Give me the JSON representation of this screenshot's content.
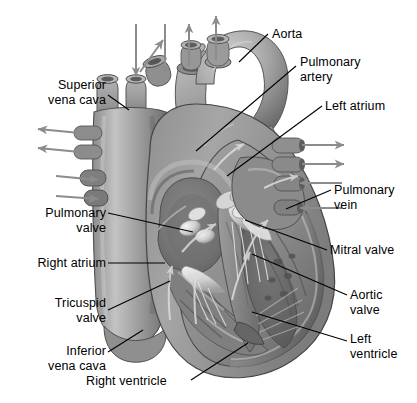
{
  "figure": {
    "background_color": "#ffffff",
    "line_color": "#000000",
    "palette": {
      "muscle_mid": "#9a9a9a",
      "muscle_dark": "#6e6e6e",
      "muscle_darker": "#575757",
      "vessel_light": "#b8b8b8",
      "chamber_dark": "#7b7b7b",
      "highlight": "#e9e9e9",
      "outline": "#2f2f2f",
      "flow_arrow": "#d8d8d8",
      "ext_arrow": "#8c8c8c"
    }
  },
  "labels": [
    {
      "id": "superior-vena-cava",
      "text": "Superior\nvena cava",
      "align": "right",
      "x": 28,
      "y": 78,
      "width": 78
    },
    {
      "id": "aorta",
      "text": "Aorta",
      "align": "left",
      "x": 272,
      "y": 27,
      "width": 60
    },
    {
      "id": "pulmonary-artery",
      "text": "Pulmonary\nartery",
      "align": "left",
      "x": 300,
      "y": 55,
      "width": 80
    },
    {
      "id": "left-atrium",
      "text": "Left atrium",
      "align": "left",
      "x": 325,
      "y": 99,
      "width": 80
    },
    {
      "id": "pulmonary-vein",
      "text": "Pulmonary\nvein",
      "align": "left",
      "x": 334,
      "y": 183,
      "width": 80
    },
    {
      "id": "pulmonary-valve",
      "text": "Pulmonary\nvalve",
      "align": "right",
      "x": 18,
      "y": 206,
      "width": 88
    },
    {
      "id": "mitral-valve",
      "text": "Mitral valve",
      "align": "left",
      "x": 330,
      "y": 243,
      "width": 86
    },
    {
      "id": "right-atrium",
      "text": "Right atrium",
      "align": "right",
      "x": 14,
      "y": 256,
      "width": 92
    },
    {
      "id": "aortic-valve",
      "text": "Aortic\nvalve",
      "align": "left",
      "x": 350,
      "y": 288,
      "width": 60
    },
    {
      "id": "tricuspid-valve",
      "text": "Tricuspid\nvalve",
      "align": "right",
      "x": 22,
      "y": 296,
      "width": 84
    },
    {
      "id": "left-ventricle",
      "text": "Left\nventricle",
      "align": "left",
      "x": 350,
      "y": 332,
      "width": 66
    },
    {
      "id": "inferior-vena-cava",
      "text": "Inferior\nvena cava",
      "align": "right",
      "x": 22,
      "y": 344,
      "width": 84
    },
    {
      "id": "right-ventricle",
      "text": "Right ventricle",
      "align": "left",
      "x": 86,
      "y": 374,
      "width": 104
    }
  ],
  "leader_lines": [
    {
      "id": "leader-superior-vena-cava",
      "from": [
        108,
        95
      ],
      "to": [
        129,
        110
      ]
    },
    {
      "id": "leader-aorta",
      "from": [
        268,
        34
      ],
      "to": [
        239,
        62
      ]
    },
    {
      "id": "leader-pulmonary-artery",
      "from": [
        296,
        66
      ],
      "to": [
        196,
        151
      ]
    },
    {
      "id": "leader-left-atrium",
      "from": [
        322,
        106
      ],
      "to": [
        227,
        176
      ]
    },
    {
      "id": "leader-pulmonary-vein",
      "from": [
        331,
        190
      ],
      "to": [
        286,
        209
      ]
    },
    {
      "id": "leader-pulmonary-valve",
      "from": [
        108,
        213
      ],
      "to": [
        193,
        232
      ]
    },
    {
      "id": "leader-mitral-valve",
      "from": [
        327,
        250
      ],
      "to": [
        245,
        220
      ]
    },
    {
      "id": "leader-right-atrium",
      "from": [
        108,
        263
      ],
      "to": [
        165,
        263
      ]
    },
    {
      "id": "leader-aortic-valve",
      "from": [
        347,
        295
      ],
      "to": [
        252,
        254
      ]
    },
    {
      "id": "leader-tricuspid-valve",
      "from": [
        108,
        310
      ],
      "to": [
        170,
        281
      ]
    },
    {
      "id": "leader-left-ventricle",
      "from": [
        347,
        341
      ],
      "to": [
        252,
        312
      ]
    },
    {
      "id": "leader-inferior-vena-cava",
      "from": [
        108,
        352
      ],
      "to": [
        143,
        330
      ]
    },
    {
      "id": "leader-right-ventricle",
      "from": [
        191,
        380
      ],
      "to": [
        248,
        343
      ]
    }
  ],
  "external_arrows": [
    {
      "id": "arrow-svc-inflow-1",
      "direction": "down",
      "from": [
        136,
        24
      ],
      "to": [
        136,
        78
      ]
    },
    {
      "id": "arrow-svc-inflow-2",
      "direction": "down",
      "from": [
        165,
        24
      ],
      "to": [
        165,
        78
      ]
    },
    {
      "id": "arrow-pulmonary-outflow-left",
      "direction": "up-right",
      "from": [
        140,
        72
      ],
      "to": [
        163,
        40
      ]
    },
    {
      "id": "arrow-pulmonary-outflow-mid",
      "direction": "up",
      "from": [
        189,
        66
      ],
      "to": [
        189,
        24
      ]
    },
    {
      "id": "arrow-aortic-outflow",
      "direction": "up",
      "from": [
        216,
        62
      ],
      "to": [
        216,
        18
      ]
    },
    {
      "id": "arrow-left-outflow-1",
      "direction": "left",
      "from": [
        80,
        134
      ],
      "to": [
        38,
        130
      ]
    },
    {
      "id": "arrow-left-outflow-2",
      "direction": "left",
      "from": [
        80,
        152
      ],
      "to": [
        38,
        148
      ]
    },
    {
      "id": "arrow-left-inflow-1",
      "direction": "right",
      "from": [
        58,
        176
      ],
      "to": [
        98,
        180
      ]
    },
    {
      "id": "arrow-left-inflow-2",
      "direction": "right",
      "from": [
        58,
        196
      ],
      "to": [
        98,
        199
      ]
    },
    {
      "id": "arrow-right-inflow-1",
      "direction": "right",
      "from": [
        300,
        146
      ],
      "to": [
        340,
        146
      ]
    },
    {
      "id": "arrow-right-inflow-2",
      "direction": "right",
      "from": [
        300,
        165
      ],
      "to": [
        340,
        165
      ]
    },
    {
      "id": "arrow-right-outflow-1",
      "direction": "left",
      "from": [
        340,
        182
      ],
      "to": [
        300,
        182
      ]
    },
    {
      "id": "arrow-right-outflow-2",
      "direction": "left",
      "from": [
        340,
        208
      ],
      "to": [
        300,
        208
      ]
    }
  ],
  "structures": [
    {
      "id": "superior-vena-cava",
      "name": "Superior vena cava"
    },
    {
      "id": "inferior-vena-cava",
      "name": "Inferior vena cava"
    },
    {
      "id": "aorta",
      "name": "Aorta"
    },
    {
      "id": "pulmonary-artery",
      "name": "Pulmonary artery"
    },
    {
      "id": "pulmonary-vein",
      "name": "Pulmonary vein"
    },
    {
      "id": "right-atrium",
      "name": "Right atrium"
    },
    {
      "id": "left-atrium",
      "name": "Left atrium"
    },
    {
      "id": "right-ventricle",
      "name": "Right ventricle"
    },
    {
      "id": "left-ventricle",
      "name": "Left ventricle"
    },
    {
      "id": "tricuspid-valve",
      "name": "Tricuspid valve"
    },
    {
      "id": "mitral-valve",
      "name": "Mitral valve"
    },
    {
      "id": "pulmonary-valve",
      "name": "Pulmonary valve"
    },
    {
      "id": "aortic-valve",
      "name": "Aortic valve"
    }
  ]
}
